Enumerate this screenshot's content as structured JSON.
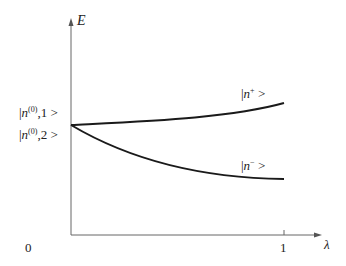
{
  "diagram": {
    "axes": {
      "y_label": "E",
      "x_label": "λ",
      "x_ticks": [
        "0",
        "1"
      ]
    },
    "states": {
      "unperturbed_1": {
        "prefix": "|",
        "symbol": "n",
        "superscript": "(0)",
        "suffix": ",1 >"
      },
      "unperturbed_2": {
        "prefix": "|",
        "symbol": "n",
        "superscript": "(0)",
        "suffix": ",2 >"
      },
      "perturbed_plus": {
        "prefix": "|",
        "symbol": "n",
        "superscript": "+",
        "suffix": " >"
      },
      "perturbed_minus": {
        "prefix": "|",
        "symbol": "n",
        "superscript": "−",
        "suffix": " >"
      }
    },
    "curves": [
      {
        "name": "upper-branch",
        "label_ref": "perturbed_plus",
        "description": "energy rises slowly then curves upward as λ → 1"
      },
      {
        "name": "lower-branch",
        "label_ref": "perturbed_minus",
        "description": "energy falls from degenerate level, flattening toward λ = 1"
      }
    ],
    "colors": {
      "axis": "#555555",
      "curve": "#1a1a1a",
      "text": "#222222"
    }
  }
}
